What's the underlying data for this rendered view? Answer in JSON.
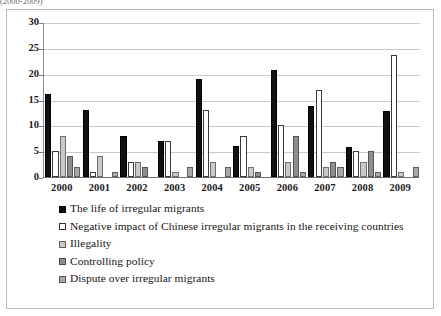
{
  "top_fragment": "(2000-2009)",
  "chart_data": {
    "type": "bar",
    "title": "",
    "subtitle": "",
    "xlabel": "",
    "ylabel": "",
    "ylim": [
      0,
      30
    ],
    "yticks": [
      0,
      5,
      10,
      15,
      20,
      25,
      30
    ],
    "grid": true,
    "legend_position": "below",
    "categories": [
      "2000",
      "2001",
      "2002",
      "2003",
      "2004",
      "2005",
      "2006",
      "2007",
      "2008",
      "2009"
    ],
    "series": [
      {
        "name": "The life of irregular migrants",
        "color": "#111111",
        "values": [
          16,
          13,
          8,
          7,
          19,
          6,
          20.7,
          13.8,
          5.8,
          12.7
        ]
      },
      {
        "name": "Negative impact of Chinese irregular migrants in the receiving countries",
        "color": "#ffffff",
        "values": [
          5,
          1,
          3,
          7,
          13,
          8,
          10,
          16.8,
          5,
          23.7
        ]
      },
      {
        "name": "Illegality",
        "color": "#c9c9c9",
        "values": [
          8,
          4,
          3,
          1,
          3,
          2,
          3,
          2,
          3,
          1
        ]
      },
      {
        "name": "Controlling policy",
        "color": "#8e8e8e",
        "values": [
          4,
          0,
          2,
          0,
          0,
          1,
          8,
          3,
          5,
          0
        ]
      },
      {
        "name": "Dispute over irregular migrants",
        "color": "#a8a8a8",
        "values": [
          2,
          1,
          0,
          2,
          2,
          0,
          1,
          2,
          1,
          2
        ]
      }
    ]
  },
  "legend": {
    "items": [
      {
        "label": "The life of irregular migrants"
      },
      {
        "label": "Negative impact of Chinese irregular migrants in the receiving countries"
      },
      {
        "label": "Illegality"
      },
      {
        "label": "Controlling policy"
      },
      {
        "label": "Dispute over irregular migrants"
      }
    ]
  }
}
